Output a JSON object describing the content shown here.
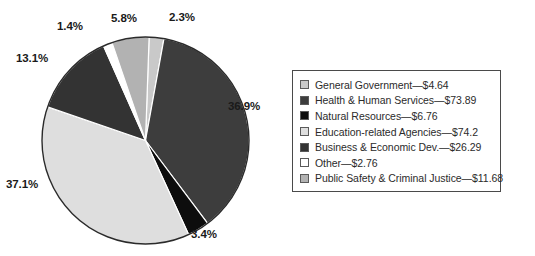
{
  "chart_data": {
    "type": "pie",
    "title": "",
    "subtitle": "",
    "xlabel": "",
    "ylabel": "",
    "grid": false,
    "legend_position": "right",
    "value_prefix": "$",
    "slices": [
      {
        "label": "General Government",
        "amount": "$4.64",
        "value": 4.64,
        "percent": "2.3%",
        "percent_value": 2.3,
        "color": "#c9c9c9"
      },
      {
        "label": "Health & Human Services",
        "amount": "$73.89",
        "value": 73.89,
        "percent": "36.9%",
        "percent_value": 36.9,
        "color": "#3d3d3d"
      },
      {
        "label": "Natural Resources",
        "amount": "$6.76",
        "value": 6.76,
        "percent": "3.4%",
        "percent_value": 3.4,
        "color": "#0d0d0d"
      },
      {
        "label": "Education-related Agencies",
        "amount": "$74.2",
        "value": 74.2,
        "percent": "37.1%",
        "percent_value": 37.1,
        "color": "#dedede"
      },
      {
        "label": "Business & Economic Dev.",
        "amount": "$26.29",
        "value": 26.29,
        "percent": "13.1%",
        "percent_value": 13.1,
        "color": "#333333"
      },
      {
        "label": "Other",
        "amount": "$2.76",
        "value": 2.76,
        "percent": "1.4%",
        "percent_value": 1.4,
        "color": "#ffffff"
      },
      {
        "label": "Public Safety & Criminal Justice",
        "amount": "$11.68",
        "value": 11.68,
        "percent": "5.8%",
        "percent_value": 5.8,
        "color": "#b2b2b2"
      }
    ]
  },
  "pie": {
    "labels": {
      "general_government": "2.3%",
      "health_human_services": "36.9%",
      "natural_resources": "3.4%",
      "education_agencies": "37.1%",
      "business_economic_dev": "13.1%",
      "other": "1.4%",
      "public_safety": "5.8%"
    }
  },
  "legend": {
    "items": [
      {
        "text": "General Government—$4.64"
      },
      {
        "text": "Health & Human Services—$73.89"
      },
      {
        "text": "Natural Resources—$6.76"
      },
      {
        "text": "Education-related Agencies—$74.2"
      },
      {
        "text": "Business & Economic Dev.—$26.29"
      },
      {
        "text": "Other—$2.76"
      },
      {
        "text": "Public Safety & Criminal Justice—$11.68"
      }
    ]
  }
}
